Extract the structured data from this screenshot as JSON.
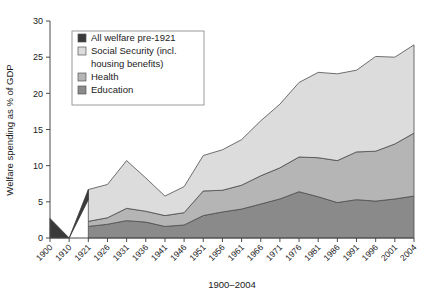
{
  "chart_data": {
    "type": "area",
    "stacked": true,
    "title": "",
    "xlabel": "1900–2004",
    "ylabel": "Welfare spending as % of GDP",
    "ylim": [
      0,
      30
    ],
    "yticks": [
      0,
      5,
      10,
      15,
      20,
      25,
      30
    ],
    "grid": false,
    "legend_position": "top-left",
    "categories": [
      "1900",
      "1910",
      "1921",
      "1926",
      "1931",
      "1936",
      "1941",
      "1946",
      "1951",
      "1956",
      "1961",
      "1966",
      "1971",
      "1976",
      "1981",
      "1986",
      "1991",
      "1996",
      "2001",
      "2004"
    ],
    "series": [
      {
        "name": "Education",
        "color": "#8a8a8a",
        "values": [
          0,
          0,
          1.6,
          1.9,
          2.4,
          2.2,
          1.6,
          1.8,
          3.1,
          3.6,
          4.0,
          4.7,
          5.4,
          6.4,
          5.7,
          4.9,
          5.3,
          5.1,
          5.4,
          5.8
        ]
      },
      {
        "name": "Health",
        "color": "#b5b5b5",
        "values": [
          0,
          0,
          0.7,
          0.9,
          1.7,
          1.5,
          1.5,
          1.7,
          3.4,
          3.0,
          3.3,
          3.9,
          4.3,
          4.8,
          5.4,
          5.8,
          6.6,
          6.9,
          7.6,
          8.7
        ]
      },
      {
        "name": "Social Security (incl. housing benefits)",
        "color": "#dcdcdc",
        "values": [
          0,
          0,
          4.4,
          4.6,
          6.6,
          4.6,
          2.7,
          3.6,
          4.9,
          5.6,
          6.3,
          7.6,
          8.8,
          10.3,
          11.8,
          12.0,
          11.3,
          13.1,
          12.0,
          12.2
        ]
      },
      {
        "name": "All welfare pre-1921",
        "color": "#3a3a3a",
        "values": [
          2.7,
          0.0,
          5.3,
          null,
          null,
          null,
          null,
          null,
          null,
          null,
          null,
          null,
          null,
          null,
          null,
          null,
          null,
          null,
          null,
          null
        ]
      }
    ],
    "totals": [
      2.7,
      0.0,
      6.7,
      7.4,
      10.7,
      8.3,
      5.8,
      7.1,
      11.4,
      12.2,
      13.6,
      16.2,
      18.5,
      21.5,
      22.9,
      22.7,
      23.2,
      25.1,
      25.0,
      26.7
    ]
  },
  "legend": {
    "entries": [
      {
        "label": "All welfare pre-1921",
        "color": "#3a3a3a"
      },
      {
        "label": "Social Security (incl.",
        "label2": "housing benefits)",
        "color": "#dcdcdc"
      },
      {
        "label": "Health",
        "color": "#b5b5b5"
      },
      {
        "label": "Education",
        "color": "#8a8a8a"
      }
    ]
  },
  "axes": {
    "y_title": "Welfare spending as % of GDP",
    "x_title": "1900–2004",
    "y_tick_labels": [
      "0",
      "5",
      "10",
      "15",
      "20",
      "25",
      "30"
    ],
    "x_tick_labels": [
      "1900",
      "1910",
      "1921",
      "1926",
      "1931",
      "1936",
      "1941",
      "1946",
      "1951",
      "1956",
      "1961",
      "1966",
      "1971",
      "1976",
      "1981",
      "1986",
      "1991",
      "1996",
      "2001",
      "2004"
    ]
  }
}
